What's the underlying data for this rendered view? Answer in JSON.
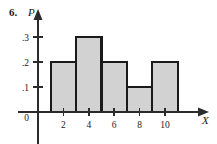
{
  "figure": {
    "problem_number": "6.",
    "y_axis_label": "P",
    "x_axis_label": "X",
    "origin_label": "0"
  },
  "chart_data": {
    "type": "bar",
    "title": "",
    "subtitle": "",
    "xlabel": "X",
    "ylabel": "P",
    "grid": false,
    "legend": false,
    "bar_style": "histogram-contiguous",
    "bar_fill_color": "#d2d2d2",
    "bar_edge_color": "#1a1a1a",
    "axis_color": "#2b2b2b",
    "bin_edges": [
      1,
      3,
      5,
      7,
      9,
      11
    ],
    "bin_centers": [
      2,
      4,
      6,
      8,
      10
    ],
    "categories": [
      "1-3",
      "3-5",
      "5-7",
      "7-9",
      "9-11"
    ],
    "values": [
      0.2,
      0.3,
      0.2,
      0.1,
      0.2
    ],
    "x_ticks": [
      2,
      4,
      6,
      8,
      10
    ],
    "x_tick_labels": [
      "2",
      "4",
      "6",
      "8",
      "10"
    ],
    "xlim": [
      0,
      12
    ],
    "y_ticks": [
      0.1,
      0.2,
      0.3
    ],
    "y_tick_labels": [
      ".1",
      ".2",
      ".3"
    ],
    "ylim": [
      0,
      0.34
    ],
    "annotations": []
  }
}
